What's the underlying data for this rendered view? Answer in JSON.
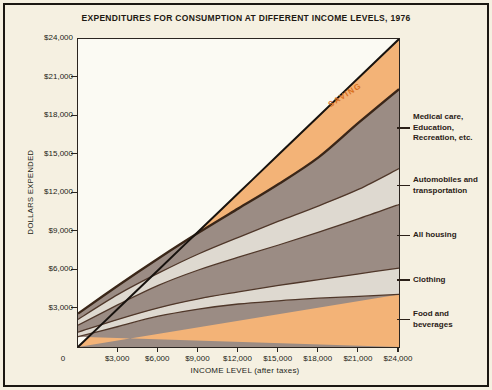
{
  "window": {
    "title": "EXPENDITURES FOR CONSUMPTION AT DIFFERENT INCOME LEVELS, 1976"
  },
  "chart_data": {
    "type": "area",
    "title": "EXPENDITURES FOR CONSUMPTION AT DIFFERENT INCOME LEVELS, 1976",
    "xlabel": "INCOME LEVEL (after taxes)",
    "ylabel": "DOLLARS EXPENDED",
    "xlim": [
      0,
      24000
    ],
    "ylim": [
      0,
      24000
    ],
    "grid": false,
    "x": [
      0,
      3000,
      6000,
      9000,
      12000,
      15000,
      18000,
      21000,
      24000
    ],
    "x_tick_labels": [
      "0",
      "$3,000",
      "$6,000",
      "$9,000",
      "$12,000",
      "$15,000",
      "$18,000",
      "$21,000",
      "$24,000"
    ],
    "y_ticks": [
      3000,
      6000,
      9000,
      12000,
      15000,
      18000,
      21000,
      24000
    ],
    "y_tick_labels": [
      "$3,000",
      "$6,000",
      "$9,000",
      "$12,000",
      "$15,000",
      "$18,000",
      "$21,000",
      "$24,000"
    ],
    "series": [
      {
        "name": "Food and beverages",
        "label_lines": [
          "Food and",
          "beverages"
        ],
        "fill": "taupe",
        "values": [
          800,
          1600,
          2400,
          2950,
          3350,
          3600,
          3800,
          3950,
          4100
        ]
      },
      {
        "name": "Clothing",
        "label_lines": [
          "Clothing"
        ],
        "fill": "lightgray",
        "values": [
          350,
          550,
          650,
          800,
          950,
          1200,
          1450,
          1750,
          2050
        ]
      },
      {
        "name": "All housing",
        "label_lines": [
          "All housing"
        ],
        "fill": "taupe",
        "values": [
          550,
          1150,
          1750,
          2250,
          2700,
          3150,
          3700,
          4300,
          4950
        ]
      },
      {
        "name": "Automobiles and transportation",
        "label_lines": [
          "Automobiles and",
          "transportation"
        ],
        "fill": "lightgray",
        "values": [
          450,
          800,
          950,
          1250,
          1550,
          1850,
          2050,
          2300,
          2800
        ]
      },
      {
        "name": "Medical care, Education, Recreation, etc.",
        "label_lines": [
          "Medical care,",
          "Education,",
          "Recreation, etc."
        ],
        "fill": "taupe",
        "values": [
          450,
          700,
          1150,
          1650,
          2250,
          2900,
          3800,
          5200,
          6200
        ]
      }
    ],
    "total_consumption": [
      2600,
      4800,
      6900,
      8900,
      10800,
      12700,
      14800,
      17500,
      20100
    ],
    "income_line": {
      "name": "Income (45-degree line)",
      "values": [
        0,
        3000,
        6000,
        9000,
        12000,
        15000,
        18000,
        21000,
        24000
      ]
    },
    "saving_label": "SAVING",
    "colors": {
      "taupe": "#9b8c84",
      "lightgray": "#ded9d0",
      "orange": "#f3b377",
      "band_edge": "#4f372a",
      "total_edge": "#3a2618",
      "income_line": "#17120e",
      "saving_text": "#d96f1e",
      "plot_bg": "#fbfaf3",
      "page_bg": "#f5f0e1"
    }
  }
}
